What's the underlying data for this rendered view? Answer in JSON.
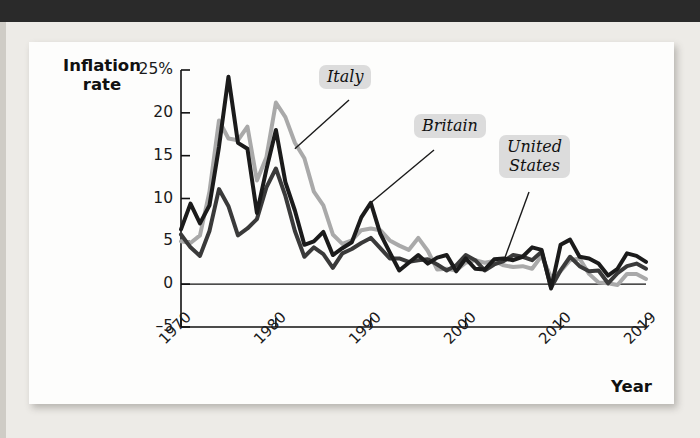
{
  "figure": {
    "y_axis_title": "Inflation\nrate",
    "x_axis_title": "Year"
  },
  "chart_data": {
    "type": "line",
    "title": "",
    "xlabel": "Year",
    "ylabel": "Inflation rate",
    "xlim": [
      1970,
      2019
    ],
    "ylim": [
      -5,
      25
    ],
    "ytick_labels": [
      "25%",
      "20",
      "15",
      "10",
      "5",
      "0",
      "–5"
    ],
    "ytick_values": [
      25,
      20,
      15,
      10,
      5,
      0,
      -5
    ],
    "xtick_labels": [
      "1970",
      "1980",
      "1990",
      "2000",
      "2010",
      "2019"
    ],
    "xtick_values": [
      1970,
      1980,
      1990,
      2000,
      2010,
      2019
    ],
    "grid": false,
    "legend_position": "inline-annotations",
    "x": [
      1970,
      1971,
      1972,
      1973,
      1974,
      1975,
      1976,
      1977,
      1978,
      1979,
      1980,
      1981,
      1982,
      1983,
      1984,
      1985,
      1986,
      1987,
      1988,
      1989,
      1990,
      1991,
      1992,
      1993,
      1994,
      1995,
      1996,
      1997,
      1998,
      1999,
      2000,
      2001,
      2002,
      2003,
      2004,
      2005,
      2006,
      2007,
      2008,
      2009,
      2010,
      2011,
      2012,
      2013,
      2014,
      2015,
      2016,
      2017,
      2018,
      2019
    ],
    "series": [
      {
        "name": "Italy",
        "color": "#a9a9a9",
        "values": [
          5.0,
          4.8,
          5.7,
          10.8,
          19.1,
          17.0,
          16.8,
          18.4,
          12.1,
          14.8,
          21.2,
          19.5,
          16.5,
          14.7,
          10.8,
          9.2,
          5.8,
          4.7,
          5.1,
          6.3,
          6.5,
          6.3,
          5.1,
          4.5,
          4.0,
          5.4,
          3.9,
          1.7,
          1.8,
          1.6,
          2.5,
          2.8,
          2.5,
          2.7,
          2.2,
          2.0,
          2.1,
          1.8,
          3.3,
          0.8,
          1.5,
          2.8,
          3.0,
          1.2,
          0.2,
          0.1,
          -0.1,
          1.2,
          1.2,
          0.6
        ],
        "style": "solid",
        "width": 4
      },
      {
        "name": "Britain",
        "color": "#1b1b1b",
        "values": [
          6.4,
          9.4,
          7.1,
          9.2,
          16.0,
          24.2,
          16.5,
          15.8,
          8.3,
          13.4,
          18.0,
          11.9,
          8.6,
          4.6,
          5.0,
          6.1,
          3.4,
          4.2,
          4.9,
          7.8,
          9.5,
          5.9,
          3.7,
          1.6,
          2.5,
          3.4,
          2.4,
          3.1,
          3.4,
          1.5,
          3.0,
          1.8,
          1.7,
          2.9,
          3.0,
          2.8,
          3.2,
          4.3,
          4.0,
          -0.5,
          4.6,
          5.2,
          3.2,
          3.0,
          2.4,
          1.0,
          1.8,
          3.6,
          3.3,
          2.6
        ],
        "style": "solid",
        "width": 4
      },
      {
        "name": "United\nStates",
        "color": "#3a3a3a",
        "values": [
          5.8,
          4.3,
          3.3,
          6.2,
          11.1,
          9.1,
          5.7,
          6.5,
          7.6,
          11.3,
          13.5,
          10.3,
          6.2,
          3.2,
          4.3,
          3.5,
          1.9,
          3.6,
          4.1,
          4.8,
          5.4,
          4.2,
          3.0,
          3.0,
          2.6,
          2.8,
          2.9,
          2.3,
          1.6,
          2.2,
          3.4,
          2.8,
          1.6,
          2.3,
          2.7,
          3.4,
          3.2,
          2.8,
          3.8,
          -0.4,
          1.6,
          3.2,
          2.1,
          1.5,
          1.6,
          0.1,
          1.3,
          2.1,
          2.4,
          1.8
        ],
        "style": "solid",
        "width": 4
      }
    ],
    "annotations": [
      {
        "label": "Italy",
        "points_to_year": 1982,
        "points_to_value": 15.8
      },
      {
        "label": "Britain",
        "points_to_year": 1990,
        "points_to_value": 9.5
      },
      {
        "label": "United\nStates",
        "points_to_year": 2004,
        "points_to_value": 2.7
      }
    ]
  },
  "bleed_text": {
    "lines": [
      "consumption and unemployment",
      "never rose above 6% in any",
      "fully sixty-three days. The",
      "economy always seemed to be",
      "the economy performed very",
      "was a crowning achievement",
      "in the history of economic",
      "policy and this success made",
      "later developments all the",
      "more surprising."
    ]
  }
}
